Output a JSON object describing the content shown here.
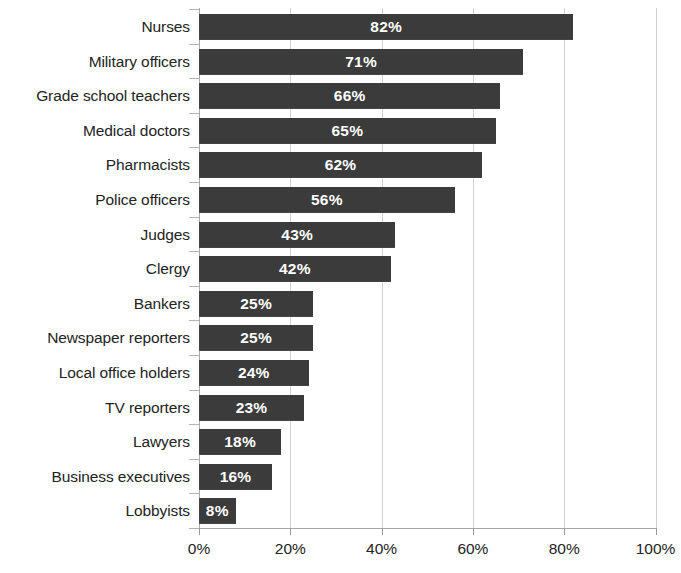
{
  "chart_data": {
    "type": "bar",
    "orientation": "horizontal",
    "title": "",
    "subtitle": "",
    "xlabel": "",
    "ylabel": "",
    "xlim": [
      0,
      100
    ],
    "xticks": [
      "0%",
      "20%",
      "40%",
      "60%",
      "80%",
      "100%"
    ],
    "xtick_values": [
      0,
      20,
      40,
      60,
      80,
      100
    ],
    "grid": "vertical",
    "legend": "none",
    "value_suffix": "%",
    "bar_color": "#3b3b3b",
    "value_label_color": "#ffffff",
    "categories": [
      "Nurses",
      "Military officers",
      "Grade school teachers",
      "Medical doctors",
      "Pharmacists",
      "Police officers",
      "Judges",
      "Clergy",
      "Bankers",
      "Newspaper reporters",
      "Local office holders",
      "TV reporters",
      "Lawyers",
      "Business executives",
      "Lobbyists"
    ],
    "values": [
      82,
      71,
      66,
      65,
      62,
      56,
      43,
      42,
      25,
      25,
      24,
      23,
      18,
      16,
      8
    ],
    "data_labels": [
      "82%",
      "71%",
      "66%",
      "65%",
      "62%",
      "56%",
      "43%",
      "42%",
      "25%",
      "25%",
      "24%",
      "23%",
      "18%",
      "16%",
      "8%"
    ]
  }
}
